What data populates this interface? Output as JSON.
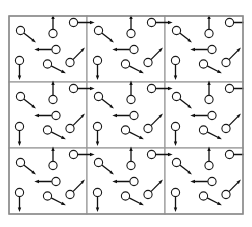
{
  "figure": {
    "width": 252,
    "height": 227,
    "background_color": "#ffffff"
  },
  "grid": {
    "name": "tile-grid",
    "columns": 3,
    "rows": 3,
    "total_tiles": 9,
    "origin_x": 9,
    "origin_y": 16,
    "cell_width": 78,
    "cell_height": 66,
    "outer_border_color": "#8a8a8a",
    "outer_border_width": 1.4,
    "divider_color": "#9a9a9a",
    "divider_width": 1.2
  },
  "vector_style": {
    "circle_radius": 4.1,
    "circle_stroke_color": "#1a1a1a",
    "circle_stroke_width": 1.1,
    "circle_fill_color": "#ffffff",
    "arrow_stroke_color": "#111111",
    "arrow_stroke_width": 1.3,
    "arrow_head_length": 4.6,
    "arrow_head_width": 3.4
  },
  "unit_cell": {
    "name": "unit-cell",
    "label": "unit cell",
    "vector_count": 7,
    "vectors": [
      {
        "id": "vector-1",
        "name": "vector-upper-left-down-right",
        "circle_x": 11.5,
        "circle_y": 14.5,
        "angle_deg": 38,
        "length": 15.5,
        "direction": "down-right"
      },
      {
        "id": "vector-2",
        "name": "vector-upper-center-up",
        "circle_x": 44.0,
        "circle_y": 17.5,
        "angle_deg": -90,
        "length": 15.0,
        "direction": "up"
      },
      {
        "id": "vector-3",
        "name": "vector-upper-right-right",
        "circle_x": 64.5,
        "circle_y": 6.5,
        "angle_deg": 0,
        "length": 17.0,
        "direction": "right"
      },
      {
        "id": "vector-4",
        "name": "vector-middle-center-left",
        "circle_x": 47.0,
        "circle_y": 33.5,
        "angle_deg": 180,
        "length": 17.5,
        "direction": "left"
      },
      {
        "id": "vector-5",
        "name": "vector-lower-left-down",
        "circle_x": 10.5,
        "circle_y": 44.5,
        "angle_deg": 90,
        "length": 15.5,
        "direction": "down"
      },
      {
        "id": "vector-6",
        "name": "vector-lower-center-down-right",
        "circle_x": 38.5,
        "circle_y": 48.0,
        "angle_deg": 27,
        "length": 16.5,
        "direction": "down-right"
      },
      {
        "id": "vector-7",
        "name": "vector-lower-right-up-right",
        "circle_x": 61.0,
        "circle_y": 46.5,
        "angle_deg": -45,
        "length": 17.0,
        "direction": "up-right"
      }
    ]
  },
  "tiles": [
    {
      "id": "tile-0-0",
      "name": "tile-row1-col1",
      "row": 0,
      "col": 0
    },
    {
      "id": "tile-0-1",
      "name": "tile-row1-col2",
      "row": 0,
      "col": 1
    },
    {
      "id": "tile-0-2",
      "name": "tile-row1-col3",
      "row": 0,
      "col": 2
    },
    {
      "id": "tile-1-0",
      "name": "tile-row2-col1",
      "row": 1,
      "col": 0
    },
    {
      "id": "tile-1-1",
      "name": "tile-row2-col2",
      "row": 1,
      "col": 1
    },
    {
      "id": "tile-1-2",
      "name": "tile-row2-col3",
      "row": 1,
      "col": 2
    },
    {
      "id": "tile-2-0",
      "name": "tile-row3-col1",
      "row": 2,
      "col": 0
    },
    {
      "id": "tile-2-1",
      "name": "tile-row3-col2",
      "row": 2,
      "col": 1
    },
    {
      "id": "tile-2-2",
      "name": "tile-row3-col3",
      "row": 2,
      "col": 2
    }
  ]
}
